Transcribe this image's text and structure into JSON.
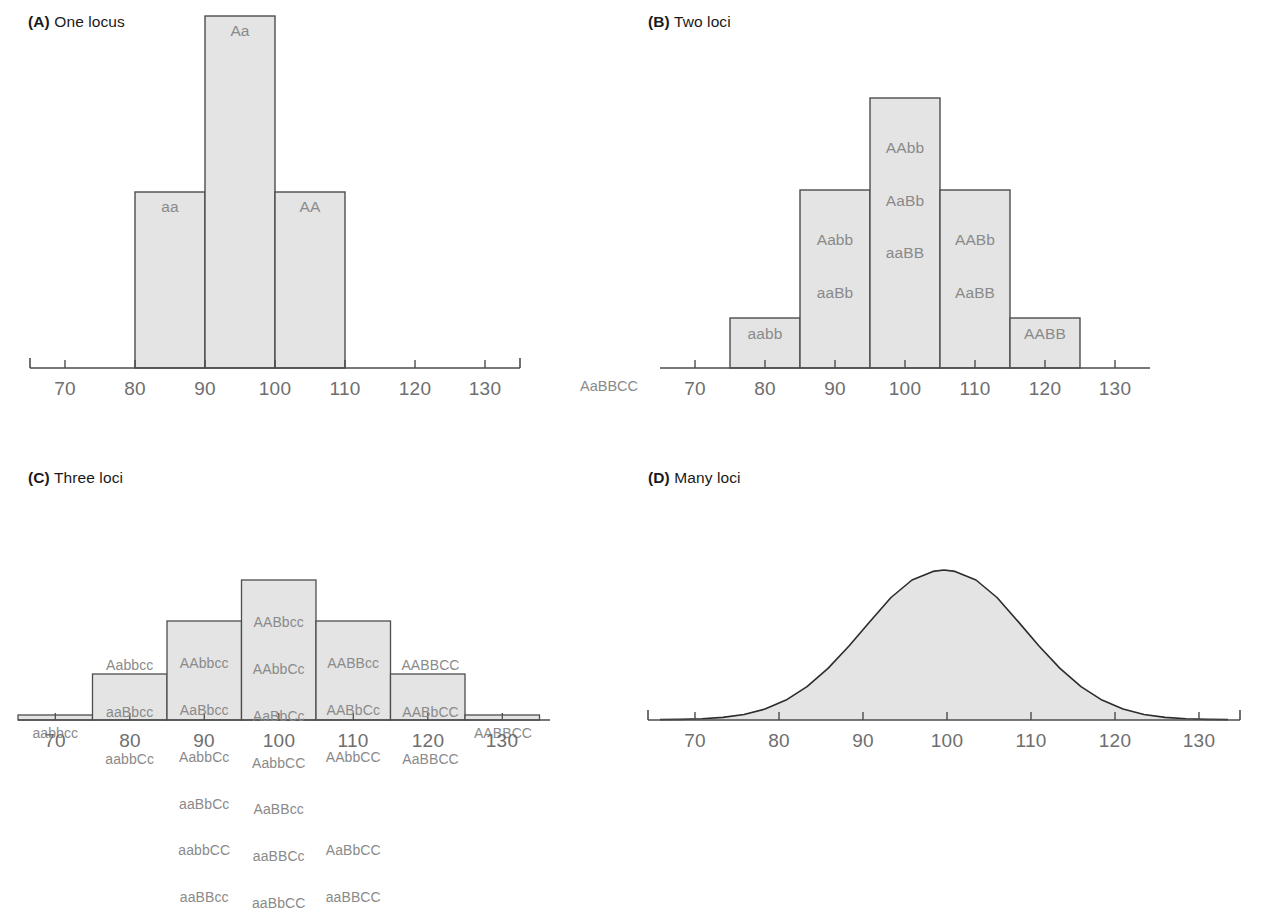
{
  "figure": {
    "caption_fragment": ""
  },
  "colors": {
    "bar_fill": "#e4e4e4",
    "bar_stroke": "#4d4d4d",
    "axis": "#4d4d4d",
    "label_text": "#8a8a8a",
    "axis_text": "#6e6e6e",
    "title_text": "#1a1a1a"
  },
  "panels": [
    {
      "id": "A",
      "letter": "(A)",
      "title": "One locus",
      "axis": {
        "min": 65,
        "max": 135,
        "ticks": [
          70,
          80,
          90,
          100,
          110,
          120,
          130
        ],
        "tick_labels": [
          "70",
          "80",
          "90",
          "100",
          "110",
          "120",
          "130"
        ]
      },
      "bars": [
        {
          "start": 80,
          "end": 90,
          "height": 0.47,
          "labels": [
            "aa"
          ]
        },
        {
          "start": 90,
          "end": 100,
          "height": 1.0,
          "labels": [
            "Aa"
          ]
        },
        {
          "start": 100,
          "end": 110,
          "height": 0.47,
          "labels": [
            "AA"
          ]
        }
      ]
    },
    {
      "id": "B",
      "letter": "(B)",
      "title": "Two loci",
      "side_label": "AaBBCC",
      "axis": {
        "min": 65,
        "max": 135,
        "ticks": [
          70,
          80,
          90,
          100,
          110,
          120,
          130
        ],
        "tick_labels": [
          "70",
          "80",
          "90",
          "100",
          "110",
          "120",
          "130"
        ]
      },
      "bars": [
        {
          "start": 75,
          "end": 85,
          "height": 0.185,
          "labels": [
            "aabb"
          ]
        },
        {
          "start": 85,
          "end": 95,
          "height": 0.66,
          "labels": [
            "Aabb",
            "aaBb"
          ]
        },
        {
          "start": 95,
          "end": 105,
          "height": 1.0,
          "labels": [
            "AAbb",
            "AaBb",
            "aaBB"
          ]
        },
        {
          "start": 105,
          "end": 115,
          "height": 0.66,
          "labels": [
            "AABb",
            "AaBB"
          ]
        },
        {
          "start": 115,
          "end": 125,
          "height": 0.185,
          "labels": [
            "AABB"
          ]
        }
      ]
    },
    {
      "id": "C",
      "letter": "(C)",
      "title": "Three loci",
      "axis": {
        "min": 65,
        "max": 135,
        "ticks": [
          70,
          80,
          90,
          100,
          110,
          120,
          130
        ],
        "tick_labels": [
          "70",
          "80",
          "90",
          "100",
          "110",
          "120",
          "130"
        ]
      },
      "bars": [
        {
          "start": 65,
          "end": 75,
          "height": 0.035,
          "labels": [
            "aabbcc"
          ],
          "label_outside": true
        },
        {
          "start": 75,
          "end": 85,
          "height": 0.33,
          "labels": [
            "Aabbcc",
            "aaBbcc",
            "aabbCc"
          ],
          "label_outside": true
        },
        {
          "start": 85,
          "end": 95,
          "height": 0.71,
          "labels": [
            "AAbbcc",
            "AaBbcc",
            "AabbCc",
            "aaBbCc",
            "aabbCC",
            "aaBBcc"
          ],
          "label_outside": false
        },
        {
          "start": 95,
          "end": 105,
          "height": 1.0,
          "labels": [
            "AABbcc",
            "AAbbCc",
            "AaBbCc",
            "AabbCC",
            "AaBBcc",
            "aaBBCc",
            "aaBbCC"
          ],
          "label_outside": false
        },
        {
          "start": 105,
          "end": 115,
          "height": 0.71,
          "labels": [
            "AABBcc",
            "AABbCc",
            "AAbbCC",
            "",
            "AaBbCC",
            "aaBBCC"
          ],
          "label_outside": false
        },
        {
          "start": 115,
          "end": 125,
          "height": 0.33,
          "labels": [
            "AABBCC",
            "AABbCC",
            "AaBBCC"
          ],
          "label_outside": true
        },
        {
          "start": 125,
          "end": 135,
          "height": 0.035,
          "labels": [
            "AABBCC"
          ],
          "label_outside": true
        }
      ]
    },
    {
      "id": "D",
      "letter": "(D)",
      "title": "Many loci",
      "axis": {
        "min": 65,
        "max": 135,
        "ticks": [
          70,
          80,
          90,
          100,
          110,
          120,
          130
        ],
        "tick_labels": [
          "70",
          "80",
          "90",
          "100",
          "110",
          "120",
          "130"
        ]
      },
      "curve": {
        "type": "normal",
        "mean": 100,
        "sd": 11.5,
        "peak_height": 1.0
      }
    }
  ]
}
